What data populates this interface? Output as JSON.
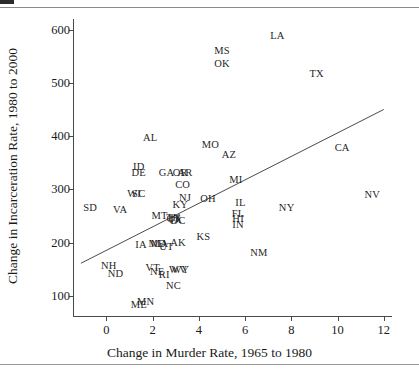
{
  "figure": {
    "title": "",
    "xaxis_title": "Change in Murder Rate, 1965 to 1980",
    "yaxis_title": "Change in Incarceration Rate, 1980 to 2000"
  },
  "chart_data": {
    "type": "scatter",
    "title": "",
    "xlabel": "Change in Murder Rate, 1965 to 1980",
    "ylabel": "Change in Incarceration Rate, 1980 to 2000",
    "xlim": [
      -1.4,
      12.4
    ],
    "ylim": [
      60,
      620
    ],
    "xticks": [
      0,
      2,
      4,
      6,
      8,
      10,
      12
    ],
    "yticks": [
      100,
      200,
      300,
      400,
      500,
      600
    ],
    "grid": false,
    "legend": null,
    "point_marker": "text-label",
    "marker_color": "#1f1f1f",
    "axis_color": "#4a4a4a",
    "trendline": {
      "present": true,
      "color": "#4a4a4a",
      "x_start": -1.1,
      "y_start": 161,
      "x_end": 12.0,
      "y_end": 450
    },
    "labels": [
      "LA",
      "MS",
      "OK",
      "TX",
      "AL",
      "MO",
      "AZ",
      "CA",
      "ID",
      "DE",
      "GA",
      "OR",
      "AR",
      "MI",
      "CO",
      "NV",
      "WI",
      "SC",
      "NJ",
      "OH",
      "IL",
      "SD",
      "VA",
      "NY",
      "FL",
      "HI",
      "MT",
      "IN",
      "KY",
      "KS",
      "IA",
      "MD",
      "MA",
      "UT",
      "AK",
      "NM",
      "NH",
      "VT",
      "NE",
      "RI",
      "ND",
      "WV",
      "WY",
      "NC",
      "MN",
      "ME",
      "TN",
      "CT",
      "PA",
      "DC"
    ],
    "x": [
      7.4,
      5.0,
      5.0,
      9.1,
      1.9,
      4.5,
      5.3,
      10.2,
      1.4,
      1.4,
      2.6,
      3.2,
      3.4,
      5.6,
      3.3,
      11.5,
      1.2,
      1.4,
      3.4,
      4.4,
      5.8,
      -0.7,
      0.6,
      7.8,
      5.7,
      5.7,
      2.3,
      5.7,
      3.2,
      4.2,
      1.5,
      2.2,
      2.3,
      2.6,
      3.1,
      6.6,
      0.1,
      2.0,
      2.2,
      2.5,
      0.4,
      3.1,
      3.2,
      2.9,
      1.7,
      1.4,
      2.9,
      2.9,
      3.0,
      3.1
    ],
    "y": [
      588,
      560,
      535,
      516,
      397,
      383,
      365,
      378,
      342,
      331,
      330,
      330,
      330,
      317,
      308,
      290,
      292,
      292,
      283,
      281,
      275,
      265,
      262,
      265,
      253,
      244,
      250,
      233,
      271,
      211,
      196,
      198,
      198,
      192,
      199,
      180,
      155,
      152,
      144,
      139,
      141,
      148,
      148,
      118,
      89,
      82,
      246,
      244,
      242,
      240
    ],
    "values": [
      {
        "label": "LA",
        "x": 7.4,
        "y": 588
      },
      {
        "label": "MS",
        "x": 5.0,
        "y": 560
      },
      {
        "label": "OK",
        "x": 5.0,
        "y": 535
      },
      {
        "label": "TX",
        "x": 9.1,
        "y": 516
      },
      {
        "label": "AL",
        "x": 1.9,
        "y": 397
      },
      {
        "label": "MO",
        "x": 4.5,
        "y": 383
      },
      {
        "label": "AZ",
        "x": 5.3,
        "y": 365
      },
      {
        "label": "CA",
        "x": 10.2,
        "y": 378
      },
      {
        "label": "ID",
        "x": 1.4,
        "y": 342
      },
      {
        "label": "DE",
        "x": 1.4,
        "y": 331
      },
      {
        "label": "GA",
        "x": 2.6,
        "y": 330
      },
      {
        "label": "OR",
        "x": 3.2,
        "y": 330
      },
      {
        "label": "AR",
        "x": 3.4,
        "y": 330
      },
      {
        "label": "MI",
        "x": 5.6,
        "y": 317
      },
      {
        "label": "CO",
        "x": 3.3,
        "y": 308
      },
      {
        "label": "NV",
        "x": 11.5,
        "y": 290
      },
      {
        "label": "WI",
        "x": 1.2,
        "y": 292
      },
      {
        "label": "SC",
        "x": 1.4,
        "y": 292
      },
      {
        "label": "NJ",
        "x": 3.4,
        "y": 283
      },
      {
        "label": "OH",
        "x": 4.4,
        "y": 281
      },
      {
        "label": "IL",
        "x": 5.8,
        "y": 275
      },
      {
        "label": "SD",
        "x": -0.7,
        "y": 265
      },
      {
        "label": "VA",
        "x": 0.6,
        "y": 262
      },
      {
        "label": "NY",
        "x": 7.8,
        "y": 265
      },
      {
        "label": "FL",
        "x": 5.7,
        "y": 253
      },
      {
        "label": "HI",
        "x": 5.7,
        "y": 244
      },
      {
        "label": "MT",
        "x": 2.3,
        "y": 250
      },
      {
        "label": "IN",
        "x": 5.7,
        "y": 233
      },
      {
        "label": "KY",
        "x": 3.2,
        "y": 271
      },
      {
        "label": "KS",
        "x": 4.2,
        "y": 211
      },
      {
        "label": "IA",
        "x": 1.5,
        "y": 196
      },
      {
        "label": "MD",
        "x": 2.2,
        "y": 198
      },
      {
        "label": "MA",
        "x": 2.3,
        "y": 198
      },
      {
        "label": "UT",
        "x": 2.6,
        "y": 192
      },
      {
        "label": "AK",
        "x": 3.1,
        "y": 199
      },
      {
        "label": "NM",
        "x": 6.6,
        "y": 180
      },
      {
        "label": "NH",
        "x": 0.1,
        "y": 155
      },
      {
        "label": "VT",
        "x": 2.0,
        "y": 152
      },
      {
        "label": "NE",
        "x": 2.2,
        "y": 144
      },
      {
        "label": "RI",
        "x": 2.5,
        "y": 139
      },
      {
        "label": "ND",
        "x": 0.4,
        "y": 141
      },
      {
        "label": "WV",
        "x": 3.1,
        "y": 148
      },
      {
        "label": "WY",
        "x": 3.2,
        "y": 148
      },
      {
        "label": "NC",
        "x": 2.9,
        "y": 118
      },
      {
        "label": "MN",
        "x": 1.7,
        "y": 89
      },
      {
        "label": "ME",
        "x": 1.4,
        "y": 82
      },
      {
        "label": "TN",
        "x": 2.9,
        "y": 246
      },
      {
        "label": "CT",
        "x": 2.9,
        "y": 244
      },
      {
        "label": "PA",
        "x": 3.0,
        "y": 242
      },
      {
        "label": "DC",
        "x": 3.1,
        "y": 240
      }
    ]
  }
}
